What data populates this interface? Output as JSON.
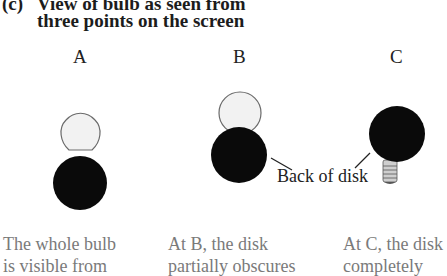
{
  "title": {
    "part": "(c)",
    "line1": "View of bulb as seen from",
    "line2": "three points on the screen"
  },
  "views": [
    {
      "label": "A",
      "caption_line1": "The whole bulb",
      "caption_line2": "is visible from"
    },
    {
      "label": "B",
      "caption_line1": "At B, the disk",
      "caption_line2": "partially obscures"
    },
    {
      "label": "C",
      "caption_line1": "At C, the disk",
      "caption_line2": "completely"
    }
  ],
  "annotation": {
    "back_of_disk": "Back of disk"
  },
  "colors": {
    "disk": "#0a0a0a",
    "glass": "#f2f2f2",
    "glass_outline": "#6a6a6a",
    "caption": "#7a7a7a"
  }
}
